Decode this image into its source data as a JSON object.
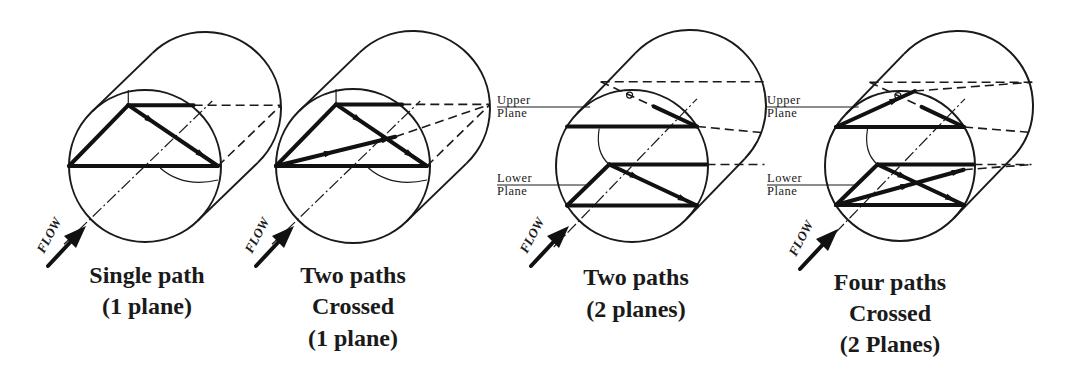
{
  "figure": {
    "colors": {
      "ink": "#1a1a1a",
      "background": "#ffffff"
    },
    "flow_label": "FLOW",
    "panels": [
      {
        "id": "single-path",
        "caption": [
          "Single path",
          "(1 plane)"
        ],
        "caption_x": 147,
        "caption_y": [
          283,
          314
        ],
        "front": {
          "cx": 145,
          "cy": 166,
          "r": 76
        },
        "offset": {
          "dx": 60,
          "dy": -58
        },
        "flow": {
          "x": 48,
          "y": 262
        },
        "planes": false
      },
      {
        "id": "two-paths-crossed",
        "caption": [
          "Two paths",
          "Crossed",
          "(1 plane)"
        ],
        "caption_x": 353,
        "caption_y": [
          283,
          314,
          346
        ],
        "front": {
          "cx": 353,
          "cy": 166,
          "r": 77
        },
        "offset": {
          "dx": 60,
          "dy": -58
        },
        "flow": {
          "x": 256,
          "y": 262
        },
        "planes": false
      },
      {
        "id": "two-paths-two-planes",
        "caption": [
          "Two paths",
          "(2 planes)"
        ],
        "caption_x": 636,
        "caption_y": [
          285,
          317
        ],
        "front": {
          "cx": 632,
          "cy": 166,
          "r": 76
        },
        "offset": {
          "dx": 58,
          "dy": -60
        },
        "flow": {
          "x": 531,
          "y": 262
        },
        "planes": true,
        "upper_label": [
          "Upper",
          "Plane"
        ],
        "lower_label": [
          "Lower",
          "Plane"
        ],
        "label_x": 497
      },
      {
        "id": "four-paths-crossed",
        "caption": [
          "Four paths",
          "Crossed",
          "(2 Planes)"
        ],
        "caption_x": 890,
        "caption_y": [
          290,
          321,
          352
        ],
        "front": {
          "cx": 900,
          "cy": 166,
          "r": 75
        },
        "offset": {
          "dx": 58,
          "dy": -60
        },
        "flow": {
          "x": 800,
          "y": 265
        },
        "planes": true,
        "upper_label": [
          "Upper",
          "Plane"
        ],
        "lower_label": [
          "Lower",
          "Plane"
        ],
        "label_x": 767
      }
    ]
  }
}
